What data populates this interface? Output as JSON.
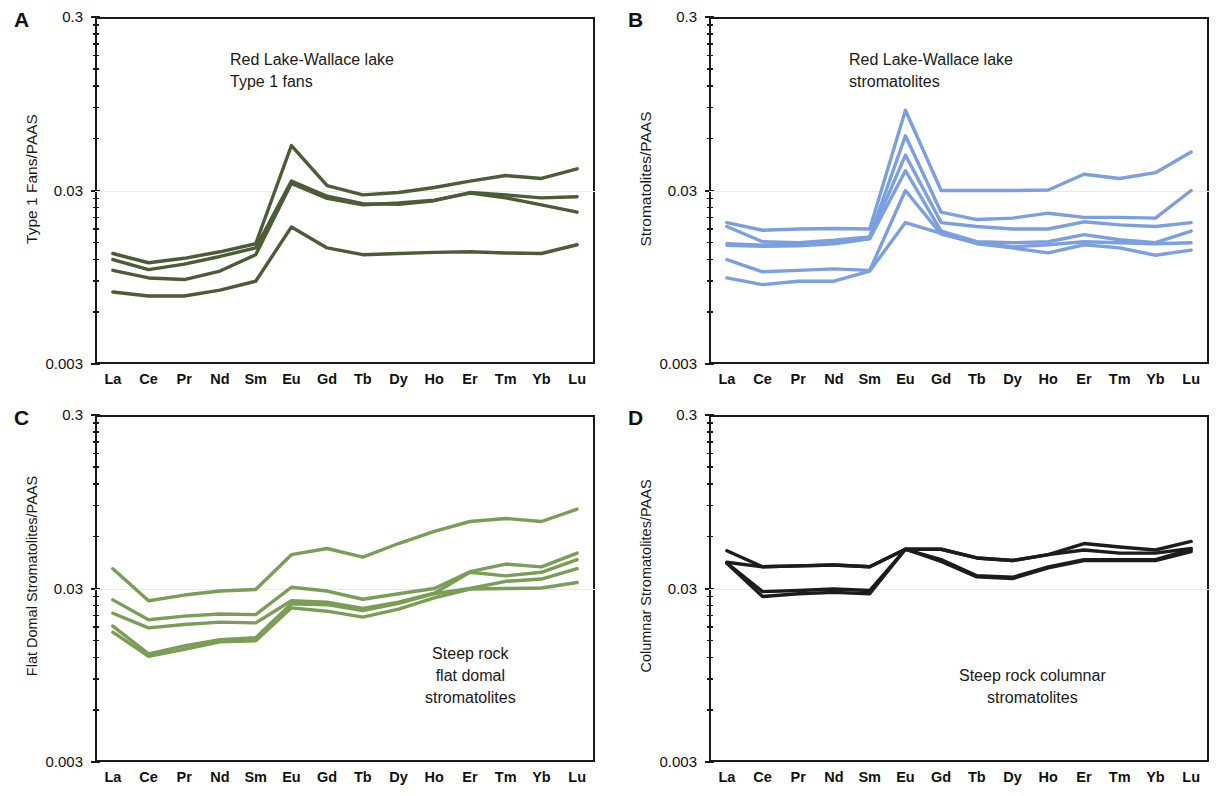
{
  "figure": {
    "xlabel": "",
    "x_categories": [
      "La",
      "Ce",
      "Pr",
      "Nd",
      "Sm",
      "Eu",
      "Gd",
      "Tb",
      "Dy",
      "Ho",
      "Er",
      "Tm",
      "Yb",
      "Lu"
    ],
    "y_ticks_major": [
      "0.3",
      "0.03",
      "0.003"
    ],
    "ylim": [
      0.003,
      0.3
    ],
    "scale": "log"
  },
  "panels": {
    "A": {
      "letter": "A",
      "ylabel": "Type 1 Fans/PAAS",
      "annotation": "Red Lake-Wallace lake\nType 1 fans",
      "color": "#4c5c36"
    },
    "B": {
      "letter": "B",
      "ylabel": "Stromatolites/PAAS",
      "annotation": "Red Lake-Wallace lake\nstromatolites",
      "color": "#7b9fe0"
    },
    "C": {
      "letter": "C",
      "ylabel": "Flat Domal Stromatolites/PAAS",
      "annotation": "Steep rock\nflat domal\nstromatolites",
      "color": "#7a9e55"
    },
    "D": {
      "letter": "D",
      "ylabel": "Columnar Stromatolites/PAAS",
      "annotation": "Steep rock columnar\nstromatolites",
      "color": "#1c1c1c"
    }
  },
  "chart_data": [
    {
      "panel": "A",
      "type": "line",
      "title": "Red Lake-Wallace lake Type 1 fans",
      "xlabel": "",
      "ylabel": "Type 1 Fans/PAAS",
      "ylim": [
        0.003,
        0.3
      ],
      "yscale": "log",
      "grid": true,
      "legend": "none",
      "color": "#4c5c36",
      "categories": [
        "La",
        "Ce",
        "Pr",
        "Nd",
        "Sm",
        "Eu",
        "Gd",
        "Tb",
        "Dy",
        "Ho",
        "Er",
        "Tm",
        "Yb",
        "Lu"
      ],
      "series": [
        {
          "name": "fan-1",
          "values": [
            0.013,
            0.0115,
            0.0122,
            0.0133,
            0.0148,
            0.0545,
            0.032,
            0.0283,
            0.0292,
            0.0312,
            0.034,
            0.0366,
            0.0352,
            0.04
          ]
        },
        {
          "name": "fan-2",
          "values": [
            0.012,
            0.0105,
            0.0113,
            0.0125,
            0.014,
            0.034,
            0.0278,
            0.0252,
            0.025,
            0.0262,
            0.0292,
            0.0283,
            0.0272,
            0.0276
          ]
        },
        {
          "name": "fan-3",
          "values": [
            0.0104,
            0.0094,
            0.0092,
            0.0103,
            0.0128,
            0.033,
            0.027,
            0.0248,
            0.0254,
            0.0264,
            0.029,
            0.0272,
            0.0248,
            0.0225
          ]
        },
        {
          "name": "fan-4",
          "values": [
            0.0078,
            0.0074,
            0.0074,
            0.008,
            0.009,
            0.0185,
            0.014,
            0.0128,
            0.013,
            0.0132,
            0.0133,
            0.0131,
            0.013,
            0.0146
          ]
        }
      ]
    },
    {
      "panel": "B",
      "type": "line",
      "title": "Red Lake-Wallace lake stromatolites",
      "xlabel": "",
      "ylabel": "Stromatolites/PAAS",
      "ylim": [
        0.003,
        0.3
      ],
      "yscale": "log",
      "grid": true,
      "legend": "none",
      "color": "#7b9fe0",
      "categories": [
        "La",
        "Ce",
        "Pr",
        "Nd",
        "Sm",
        "Eu",
        "Gd",
        "Tb",
        "Dy",
        "Ho",
        "Er",
        "Tm",
        "Yb",
        "Lu"
      ],
      "series": [
        {
          "name": "strom-1",
          "values": [
            0.0196,
            0.0177,
            0.018,
            0.0181,
            0.018,
            0.087,
            0.03,
            0.03,
            0.03,
            0.0302,
            0.0372,
            0.0352,
            0.038,
            0.05
          ]
        },
        {
          "name": "strom-2",
          "values": [
            0.0186,
            0.0152,
            0.015,
            0.0155,
            0.0162,
            0.062,
            0.0225,
            0.0204,
            0.0208,
            0.0222,
            0.021,
            0.021,
            0.0208,
            0.03
          ]
        },
        {
          "name": "strom-3",
          "values": [
            0.0148,
            0.0145,
            0.0147,
            0.0151,
            0.016,
            0.048,
            0.0196,
            0.0186,
            0.018,
            0.018,
            0.0198,
            0.019,
            0.0186,
            0.0196
          ]
        },
        {
          "name": "strom-4",
          "values": [
            0.0145,
            0.0143,
            0.0144,
            0.0148,
            0.0158,
            0.039,
            0.0175,
            0.0152,
            0.015,
            0.0152,
            0.0167,
            0.0156,
            0.015,
            0.0175
          ]
        },
        {
          "name": "strom-5",
          "values": [
            0.012,
            0.0102,
            0.0104,
            0.0106,
            0.0104,
            0.03,
            0.0168,
            0.015,
            0.0142,
            0.0146,
            0.0152,
            0.015,
            0.0148,
            0.015
          ]
        },
        {
          "name": "strom-6",
          "values": [
            0.0094,
            0.0086,
            0.009,
            0.009,
            0.0103,
            0.0196,
            0.017,
            0.0148,
            0.014,
            0.0131,
            0.0146,
            0.014,
            0.0127,
            0.0136
          ]
        }
      ]
    },
    {
      "panel": "C",
      "type": "line",
      "title": "Steep rock flat domal stromatolites",
      "xlabel": "",
      "ylabel": "Flat Domal Stromatolites/PAAS",
      "ylim": [
        0.003,
        0.3
      ],
      "yscale": "log",
      "grid": true,
      "legend": "none",
      "color": "#7a9e55",
      "categories": [
        "La",
        "Ce",
        "Pr",
        "Nd",
        "Sm",
        "Eu",
        "Gd",
        "Tb",
        "Dy",
        "Ho",
        "Er",
        "Tm",
        "Yb",
        "Lu"
      ],
      "series": [
        {
          "name": "fd-1",
          "values": [
            0.039,
            0.0255,
            0.0275,
            0.029,
            0.0296,
            0.047,
            0.051,
            0.0455,
            0.0545,
            0.064,
            0.073,
            0.076,
            0.073,
            0.086
          ]
        },
        {
          "name": "fd-2",
          "values": [
            0.0258,
            0.0198,
            0.0208,
            0.0214,
            0.0212,
            0.0305,
            0.029,
            0.026,
            0.028,
            0.03,
            0.0375,
            0.0415,
            0.04,
            0.048
          ]
        },
        {
          "name": "fd-3",
          "values": [
            0.0216,
            0.0178,
            0.0186,
            0.0192,
            0.019,
            0.0255,
            0.025,
            0.023,
            0.025,
            0.0282,
            0.0372,
            0.0355,
            0.0372,
            0.044
          ]
        },
        {
          "name": "fd-4",
          "values": [
            0.0182,
            0.0126,
            0.014,
            0.0152,
            0.0156,
            0.0245,
            0.0242,
            0.0224,
            0.0246,
            0.028,
            0.03,
            0.033,
            0.034,
            0.039
          ]
        },
        {
          "name": "fd-5",
          "values": [
            0.0168,
            0.0122,
            0.0134,
            0.0148,
            0.015,
            0.0232,
            0.0222,
            0.0205,
            0.0228,
            0.0265,
            0.0298,
            0.03,
            0.0302,
            0.0325
          ]
        }
      ]
    },
    {
      "panel": "D",
      "type": "line",
      "title": "Steep rock columnar stromatolites",
      "xlabel": "",
      "ylabel": "Columnar Stromatolites/PAAS",
      "ylim": [
        0.003,
        0.3
      ],
      "yscale": "log",
      "grid": true,
      "legend": "none",
      "color": "#1c1c1c",
      "categories": [
        "La",
        "Ce",
        "Pr",
        "Nd",
        "Sm",
        "Eu",
        "Gd",
        "Tb",
        "Dy",
        "Ho",
        "Er",
        "Tm",
        "Yb",
        "Lu"
      ],
      "series": [
        {
          "name": "col-1",
          "values": [
            0.0495,
            0.04,
            0.0405,
            0.041,
            0.04,
            0.0505,
            0.0505,
            0.045,
            0.0435,
            0.047,
            0.0545,
            0.052,
            0.05,
            0.056
          ]
        },
        {
          "name": "col-2",
          "values": [
            0.0425,
            0.04,
            0.0405,
            0.041,
            0.04,
            0.0505,
            0.0505,
            0.045,
            0.0435,
            0.047,
            0.05,
            0.048,
            0.048,
            0.051
          ]
        },
        {
          "name": "col-3",
          "values": [
            0.042,
            0.0288,
            0.0292,
            0.0298,
            0.0292,
            0.0505,
            0.044,
            0.0355,
            0.0348,
            0.04,
            0.044,
            0.044,
            0.044,
            0.0505
          ]
        },
        {
          "name": "col-4",
          "values": [
            0.042,
            0.027,
            0.028,
            0.0285,
            0.028,
            0.0505,
            0.043,
            0.035,
            0.0342,
            0.0395,
            0.0435,
            0.0435,
            0.0435,
            0.049
          ]
        }
      ]
    }
  ]
}
